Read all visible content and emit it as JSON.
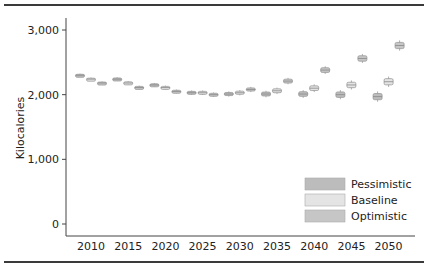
{
  "chart_data": {
    "type": "box",
    "title": "",
    "xlabel": "",
    "ylabel": "Kilocalories",
    "ylim": [
      0,
      3000
    ],
    "yticks": [
      0,
      1000,
      2000,
      3000
    ],
    "ytick_labels": [
      "0",
      "1,000",
      "2,000",
      "3,000"
    ],
    "categories": [
      "2010",
      "2015",
      "2020",
      "2025",
      "2030",
      "2035",
      "2040",
      "2045",
      "2050"
    ],
    "grid": false,
    "legend_position": "bottom-right",
    "series": [
      {
        "name": "Pessimistic",
        "color": "#bcbcbc",
        "values": [
          2300,
          2240,
          2150,
          2030,
          2010,
          2010,
          2010,
          2000,
          1970
        ]
      },
      {
        "name": "Baseline",
        "color": "#e4e4e4",
        "values": [
          2240,
          2180,
          2110,
          2030,
          2030,
          2060,
          2100,
          2150,
          2200
        ]
      },
      {
        "name": "Optimistic",
        "color": "#c6c6c6",
        "values": [
          2180,
          2110,
          2050,
          2000,
          2080,
          2210,
          2380,
          2560,
          2760
        ]
      }
    ],
    "box_half_range": [
      25,
      30,
      30,
      35,
      40,
      50,
      60,
      70,
      80
    ]
  }
}
